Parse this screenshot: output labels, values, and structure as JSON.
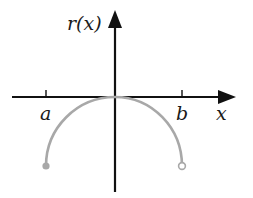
{
  "diagram": {
    "type": "function-graph",
    "y_axis_label": "r(x)",
    "x_axis_label": "x",
    "tick_labels": {
      "left": "a",
      "right": "b"
    },
    "curve": {
      "description": "Downward semicircular arc from x=a to x=b, with its maximum touching the origin",
      "left_endpoint": "closed",
      "right_endpoint": "open"
    },
    "colors": {
      "axes": "#111111",
      "curve": "#a8a8a8",
      "text": "#1a1a1a",
      "background": "#ffffff"
    }
  }
}
